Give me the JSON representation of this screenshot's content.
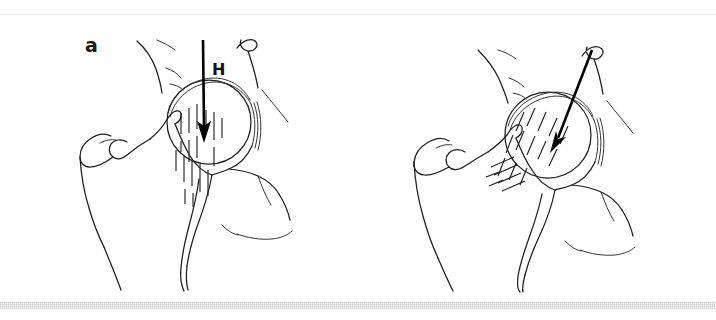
{
  "figure": {
    "background_color": "#ffffff",
    "line_color": "#1d1d1d",
    "panels": [
      {
        "id": "a",
        "label": "a",
        "force_label": "H",
        "force_direction": "vertical-downward",
        "description": "Normal hip: resultant force H acts vertically through the femoral head; trabecular stress lines run vertically through the femoral neck.",
        "arrow": {
          "x1": 203,
          "y1": 40,
          "x2": 204,
          "y2": 141
        },
        "trabecular_orientation": "vertical"
      },
      {
        "id": "b",
        "label": "b",
        "force_label": "H",
        "force_direction": "oblique-downward-medial",
        "description": "Dysplastic hip: resultant force H acts obliquely, directed infero-medially across the femoral head; trabecular stress lines run obliquely.",
        "arrow": {
          "x1": 234,
          "y1": 50,
          "x2": 193,
          "y2": 152
        },
        "trabecular_orientation": "oblique"
      }
    ],
    "annotations": {
      "force_symbol": "H",
      "force_symbol_meaning": "resultant hip joint force"
    },
    "icons": {
      "arrow": "down-arrow-icon"
    }
  }
}
